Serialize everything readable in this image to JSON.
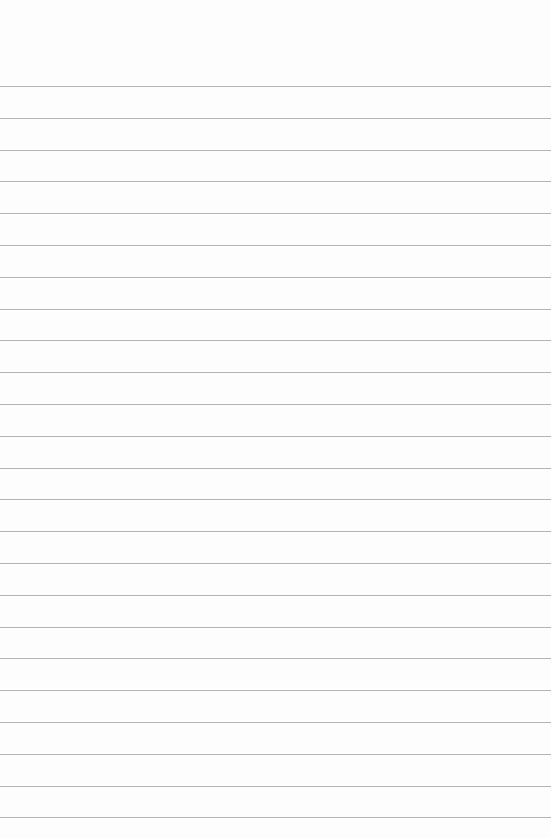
{
  "paper": {
    "type": "lined-paper",
    "background_color": "#fdfdfd",
    "line_color": "#b4b4b4",
    "first_line_y": 86,
    "line_spacing": 31.8,
    "line_count": 24
  }
}
